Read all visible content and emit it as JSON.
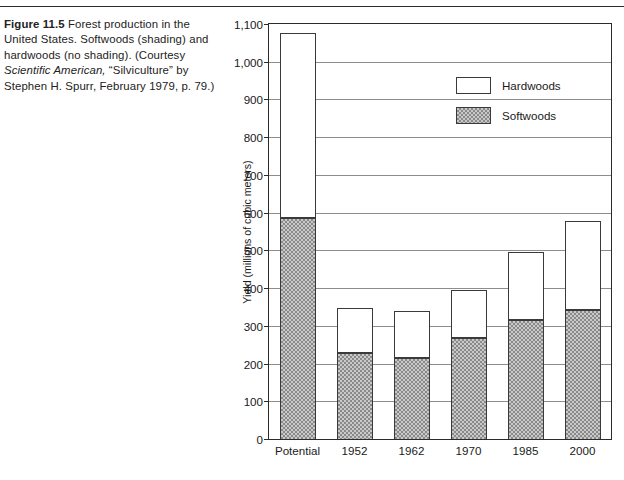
{
  "figure": {
    "label": "Figure 11.5",
    "caption_part1": " Forest production in the United States. Softwoods (shading) and hardwoods (no shading). (Courtesy ",
    "caption_italic1": "Scientific American,",
    "caption_part2": " “Silviculture” by Stephen H. Spurr, February 1979, p. 79.)"
  },
  "chart_data": {
    "type": "bar",
    "subtype": "stacked",
    "title": "",
    "xlabel": "",
    "ylabel": "Yield (millions of cubic meters)",
    "categories": [
      "Potential",
      "1952",
      "1962",
      "1970",
      "1985",
      "2000"
    ],
    "series": [
      {
        "name": "Softwoods",
        "fill": "shaded",
        "values": [
          585,
          228,
          216,
          268,
          316,
          343
        ]
      },
      {
        "name": "Hardwoods",
        "fill": "none",
        "values": [
          487,
          117,
          120,
          124,
          177,
          232
        ]
      }
    ],
    "totals": [
      1072,
      345,
      336,
      392,
      493,
      575
    ],
    "ylim": [
      0,
      1100
    ],
    "yticks": [
      0,
      100,
      200,
      300,
      400,
      500,
      600,
      700,
      800,
      900,
      1000,
      1100
    ],
    "ytick_labels": [
      "0",
      "100",
      "200",
      "300",
      "400",
      "500",
      "600",
      "700",
      "800",
      "900",
      "1,000",
      "1,100"
    ],
    "grid": true,
    "legend_position": "upper-right-inside"
  },
  "legend": {
    "entries": [
      {
        "label": "Hardwoods",
        "swatch": "white"
      },
      {
        "label": "Softwoods",
        "swatch": "shaded"
      }
    ]
  }
}
